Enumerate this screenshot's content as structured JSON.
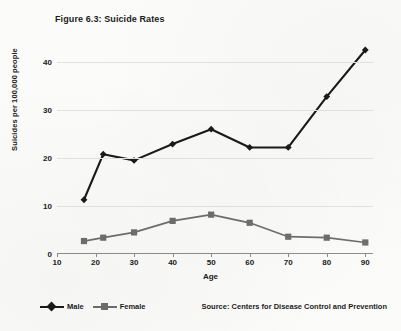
{
  "figure": {
    "title": "Figure 6.3: Suicide Rates",
    "source_note": "Source: Centers for Disease Control and Prevention"
  },
  "legend": {
    "position": "bottom-left",
    "entries": [
      {
        "label": "Male",
        "marker": "diamond-marker",
        "color": "#1a1a1a"
      },
      {
        "label": "Female",
        "marker": "square-marker",
        "color": "#6e6e6e"
      }
    ]
  },
  "chart_data": {
    "type": "line",
    "title": "Figure 6.3: Suicide Rates",
    "xlabel": "Age",
    "ylabel": "Suicides per 100,000 people",
    "x": [
      17,
      22,
      30,
      40,
      50,
      60,
      70,
      80,
      90
    ],
    "xlim": [
      10,
      92
    ],
    "ylim": [
      0,
      45
    ],
    "xticks": [
      10,
      20,
      30,
      40,
      50,
      60,
      70,
      80,
      90
    ],
    "yticks": [
      0,
      10,
      20,
      30,
      40
    ],
    "xtick_labels": [
      "10",
      "20",
      "30",
      "40",
      "50",
      "60",
      "70",
      "80",
      "90"
    ],
    "ytick_labels": [
      "0",
      "10",
      "20",
      "30",
      "40"
    ],
    "grid": "horizontal",
    "legend_position": "bottom-left",
    "series": [
      {
        "name": "Male",
        "color": "#1a1a1a",
        "marker": "diamond",
        "values": [
          11.3,
          20.8,
          19.5,
          22.9,
          26.0,
          22.2,
          22.2,
          32.8,
          42.5
        ]
      },
      {
        "name": "Female",
        "color": "#6e6e6e",
        "marker": "square",
        "values": [
          2.7,
          3.4,
          4.5,
          6.9,
          8.2,
          6.5,
          3.6,
          3.4,
          2.4
        ]
      }
    ],
    "annotations": [
      "Source: Centers for Disease Control and Prevention"
    ]
  },
  "colors": {
    "male": "#1a1a1a",
    "female": "#6e6e6e",
    "grid": "#e3e3e1",
    "axis": "#8d8d8d",
    "text": "#1b1b1b",
    "background": "#fbfbfa"
  }
}
